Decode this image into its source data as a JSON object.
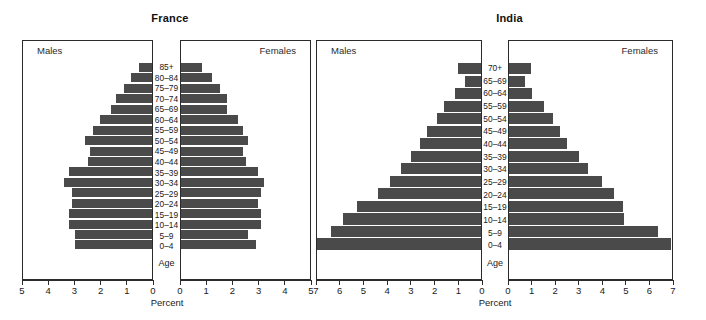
{
  "figure": {
    "background": "#ffffff",
    "bar_color": "#4a4a4a",
    "axis_color": "#2b2b2b"
  },
  "charts": [
    {
      "id": "france",
      "title": "France",
      "males_label": "Males",
      "females_label": "Females",
      "age_caption": "Age",
      "percent_label": "Percent",
      "xmax": 5,
      "ticks": [
        "5",
        "4",
        "3",
        "2",
        "1",
        "0"
      ],
      "ticks_right": [
        "0",
        "1",
        "2",
        "3",
        "4",
        "5"
      ]
    },
    {
      "id": "india",
      "title": "India",
      "males_label": "Males",
      "females_label": "Females",
      "age_caption": "Age",
      "percent_label": "Percent",
      "xmax": 7,
      "ticks": [
        "7",
        "6",
        "5",
        "4",
        "3",
        "2",
        "1",
        "0"
      ],
      "ticks_right": [
        "0",
        "1",
        "2",
        "3",
        "4",
        "5",
        "6",
        "7"
      ]
    }
  ],
  "chart_data": [
    {
      "type": "bar",
      "subtype": "population-pyramid",
      "title": "France",
      "xlabel": "Percent",
      "ylabel": "Age",
      "xlim": [
        0,
        5
      ],
      "grid": false,
      "legend": [
        "Males",
        "Females"
      ],
      "legend_position": "inside-panel-top",
      "categories": [
        "85+",
        "80–84",
        "75–79",
        "70–74",
        "65–69",
        "60–64",
        "55–59",
        "50–54",
        "45–49",
        "40–44",
        "35–39",
        "30–34",
        "25–29",
        "20–24",
        "15–19",
        "10–14",
        "5–9",
        "0–4"
      ],
      "series": [
        {
          "name": "Males",
          "values": [
            0.5,
            0.8,
            1.1,
            1.4,
            1.6,
            2.0,
            2.3,
            2.6,
            2.4,
            2.5,
            3.2,
            3.4,
            3.1,
            3.1,
            3.2,
            3.2,
            3.0,
            3.0
          ]
        },
        {
          "name": "Females",
          "values": [
            0.8,
            1.2,
            1.5,
            1.8,
            1.8,
            2.2,
            2.4,
            2.6,
            2.4,
            2.5,
            3.0,
            3.2,
            3.1,
            3.0,
            3.1,
            3.1,
            2.6,
            2.9
          ]
        }
      ]
    },
    {
      "type": "bar",
      "subtype": "population-pyramid",
      "title": "India",
      "xlabel": "Percent",
      "ylabel": "Age",
      "xlim": [
        0,
        7
      ],
      "grid": false,
      "legend": [
        "Males",
        "Females"
      ],
      "legend_position": "inside-panel-top",
      "categories": [
        "70+",
        "65–69",
        "60–64",
        "55–59",
        "50–54",
        "45–49",
        "40–44",
        "35–39",
        "30–34",
        "25–29",
        "20–24",
        "15–19",
        "10–14",
        "5–9",
        "0–4"
      ],
      "series": [
        {
          "name": "Males",
          "values": [
            1.0,
            0.7,
            1.1,
            1.6,
            1.9,
            2.3,
            2.6,
            3.0,
            3.4,
            3.9,
            4.4,
            5.3,
            5.9,
            6.4,
            7.0
          ]
        },
        {
          "name": "Females",
          "values": [
            0.95,
            0.7,
            1.0,
            1.5,
            1.9,
            2.2,
            2.5,
            3.0,
            3.4,
            4.0,
            4.5,
            4.9,
            4.95,
            6.4,
            6.95
          ]
        }
      ]
    }
  ]
}
